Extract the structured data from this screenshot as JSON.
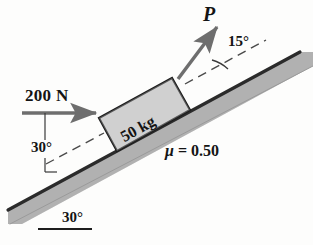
{
  "figure": {
    "background_color": "#fdfdfc",
    "labels": {
      "applied_force_horizontal": "200 N",
      "force_p": "P",
      "angle_p": "15°",
      "angle_force": "30°",
      "angle_incline": "30°",
      "block_mass": "50 kg",
      "friction_coefficient": "μ = 0.50",
      "friction_symbol": "μ",
      "friction_value": "= 0.50"
    },
    "colors": {
      "incline_fill": "#b6b6b6",
      "incline_edge": "#2b2b2b",
      "block_fill": "#d4d4d4",
      "block_edge": "#1d1d1d",
      "arrow": "#6e6e6e",
      "dashed_line": "#4a4a4a",
      "text": "#141414"
    },
    "geometry": {
      "incline_angle_deg": 30,
      "p_angle_from_incline_deg": 15,
      "applied_force_angle_from_incline_deg": 30,
      "block_mass_kg": 50,
      "applied_force_N": 200,
      "mu": 0.5
    }
  }
}
